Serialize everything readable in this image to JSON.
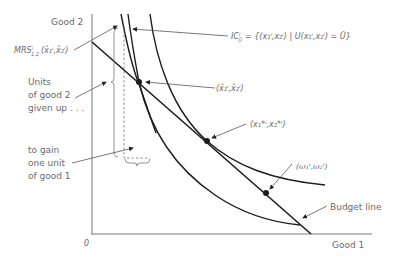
{
  "axes": {
    "y_label": "Good 2",
    "x_label": "Good 1",
    "origin": "0"
  },
  "labels": {
    "mrs": "MRS",
    "mrs_sup": "i",
    "mrs_sub": "1,2",
    "mrs_args": "(x̂₁ⁱ,x̂₂ⁱ)",
    "indiff_set": "IC",
    "indiff_set_sub": "Ū",
    "indiff_set_sup": "i",
    "indiff_def": "= {(x₁ⁱ,x₂ⁱ) | U(x₁ⁱ,x₂ⁱ) = Ū}",
    "units_line1": "Units",
    "units_line2": "of good 2",
    "units_line3": "given up . . .",
    "gain_line1": "to gain",
    "gain_line2": "one unit",
    "gain_line3": "of good 1",
    "point_hat": "(x̂₁ⁱ,x̂₂ⁱ)",
    "point_star": "(x₁*ⁱ,x₂*ⁱ)",
    "point_omega": "(ω₁ⁱ,ω₂ⁱ)",
    "budget_line": "Budget line"
  },
  "colors": {
    "curve": "#1c1c1c",
    "text": "#6a6a6a",
    "axis": "#7a7a7a"
  }
}
